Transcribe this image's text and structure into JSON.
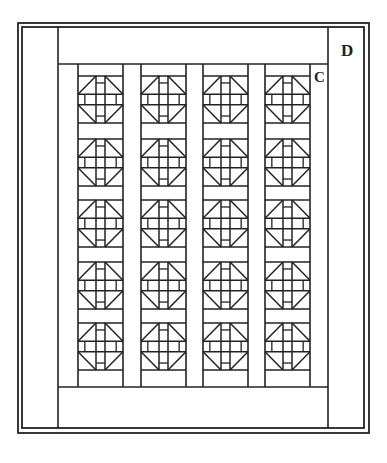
{
  "diagram": {
    "type": "quilt-layout",
    "stroke_color": "#222222",
    "background": "#ffffff",
    "labels": {
      "border": "D",
      "sashing": "C"
    },
    "grid": {
      "columns": 4,
      "rows": 5,
      "block_name": "pieced-block"
    },
    "frame": {
      "outer": [
        18,
        23,
        369,
        433
      ],
      "inner": [
        22,
        27,
        364,
        428
      ],
      "left_border_x": 58,
      "right_border_x": 328,
      "top_band_bottom_y": 64,
      "bottom_band_top_y": 387
    },
    "columns_x": [
      [
        78,
        123
      ],
      [
        141,
        186
      ],
      [
        203,
        248
      ],
      [
        265,
        310
      ]
    ],
    "block_rows_y": [
      [
        76,
        123
      ],
      [
        139,
        186
      ],
      [
        200,
        247
      ],
      [
        262,
        309
      ],
      [
        323,
        370
      ]
    ]
  }
}
